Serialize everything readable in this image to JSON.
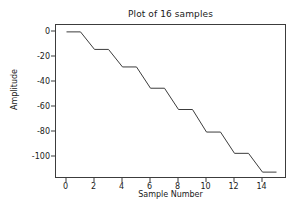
{
  "chart_data": {
    "type": "line",
    "title": "Plot of 16 samples",
    "xlabel": "Sample Number",
    "ylabel": "Amplitude",
    "x": [
      0,
      1,
      2,
      3,
      4,
      5,
      6,
      7,
      8,
      9,
      10,
      11,
      12,
      13,
      14,
      15
    ],
    "values": [
      0,
      0,
      -14,
      -14,
      -28,
      -28,
      -45,
      -45,
      -62,
      -62,
      -80,
      -80,
      -97,
      -97,
      -112,
      -112
    ],
    "series": [
      {
        "name": "samples",
        "values": [
          0,
          0,
          -14,
          -14,
          -28,
          -28,
          -45,
          -45,
          -62,
          -62,
          -80,
          -80,
          -97,
          -97,
          -112,
          -112
        ]
      }
    ],
    "xlim": [
      -0.75,
      15.75
    ],
    "ylim": [
      -117.5,
      5.5
    ],
    "xticks": [
      0,
      2,
      4,
      6,
      8,
      10,
      12,
      14
    ],
    "xtick_labels": [
      "0",
      "2",
      "4",
      "6",
      "8",
      "10",
      "12",
      "14"
    ],
    "yticks": [
      0,
      -20,
      -40,
      -60,
      -80,
      -100
    ],
    "ytick_labels": [
      "0",
      "-20",
      "-40",
      "-60",
      "-80",
      "-100"
    ],
    "grid": false,
    "legend": false,
    "line_color": "#3c3c3c",
    "line_width": 1,
    "background": "#ffffff"
  }
}
